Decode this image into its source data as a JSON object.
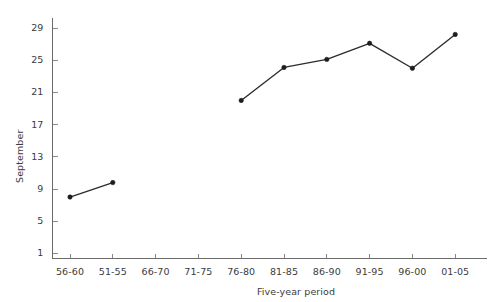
{
  "chart_data": {
    "type": "line",
    "title": "",
    "subtitle": "",
    "xlabel": "Five-year period",
    "ylabel": "September",
    "categories": [
      "56-60",
      "51-55",
      "66-70",
      "71-75",
      "76-80",
      "81-85",
      "86-90",
      "91-95",
      "96-00",
      "01-05"
    ],
    "yticks": [
      1,
      5,
      9,
      13,
      17,
      21,
      25,
      29
    ],
    "ylim": [
      1,
      30.5
    ],
    "grid": false,
    "legend": false,
    "legend_position": "none",
    "marker": "filled-circle",
    "line_color": "#2b2b2b",
    "marker_color": "#1d1d1d",
    "axis_color": "#6b6b6b",
    "text_color": "#3b3b3b",
    "background": "#ffffff",
    "series": [
      {
        "name": "September",
        "points": [
          {
            "category": "56-60",
            "value": 8.0
          },
          {
            "category": "51-55",
            "value": 9.8
          },
          {
            "category": "66-70",
            "value": null
          },
          {
            "category": "71-75",
            "value": null
          },
          {
            "category": "76-80",
            "value": 20.0
          },
          {
            "category": "81-85",
            "value": 24.1
          },
          {
            "category": "86-90",
            "value": 25.1
          },
          {
            "category": "91-95",
            "value": 27.1
          },
          {
            "category": "96-00",
            "value": 24.0
          },
          {
            "category": "01-05",
            "value": 28.2
          }
        ]
      }
    ]
  },
  "axis": {
    "y_title": "September",
    "x_title": "Five-year period",
    "y_tick_labels": [
      "1",
      "5",
      "9",
      "13",
      "17",
      "21",
      "25",
      "29"
    ],
    "x_tick_labels": [
      "56-60",
      "51-55",
      "66-70",
      "71-75",
      "76-80",
      "81-85",
      "86-90",
      "91-95",
      "96-00",
      "01-05"
    ]
  }
}
